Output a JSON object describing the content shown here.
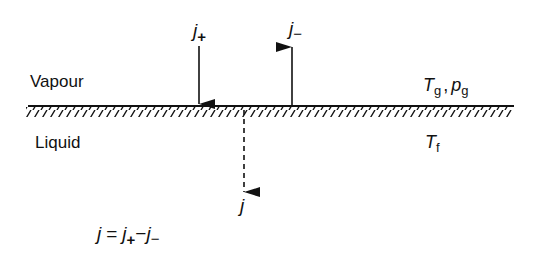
{
  "diagram": {
    "type": "phase-interface-flux",
    "regions": {
      "upper": {
        "label": "Vapour",
        "properties": {
          "T": "T",
          "T_sub": "g",
          "sep": ",",
          "rho": "p",
          "rho_sub": "g"
        }
      },
      "lower": {
        "label": "Liquid",
        "properties": {
          "T": "T",
          "T_sub": "f"
        }
      }
    },
    "fluxes": {
      "incoming": {
        "symbol": "j",
        "sub": "+",
        "direction": "down",
        "style": "solid"
      },
      "outgoing": {
        "symbol": "j",
        "sub": "−",
        "direction": "up",
        "style": "solid"
      },
      "net": {
        "symbol": "j",
        "direction": "down",
        "style": "dashed"
      }
    },
    "equation": {
      "lhs": "j",
      "eq": "=",
      "t1": "j",
      "t1_sub": "+",
      "op": "−",
      "t2": "j",
      "t2_sub": "−"
    },
    "colors": {
      "ink": "#111111",
      "background": "#ffffff"
    }
  }
}
